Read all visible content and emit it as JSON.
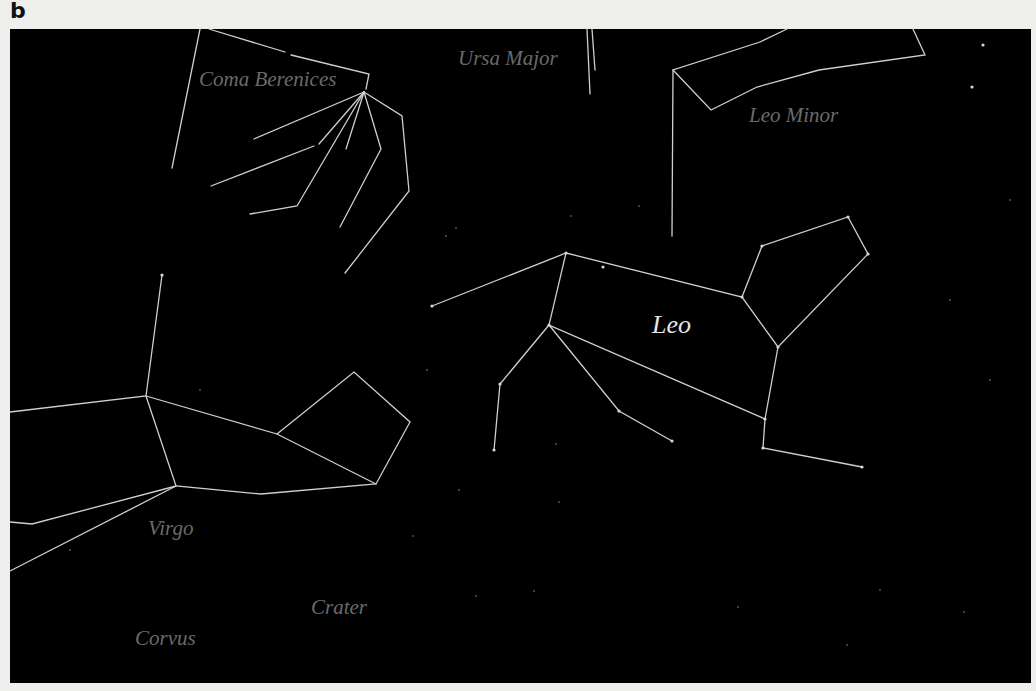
{
  "panel_label": "b",
  "sky_color": "#000000",
  "line_color": "#cfcfcf",
  "constellations": [
    {
      "id": "leo",
      "label": "Leo",
      "highlighted": true
    },
    {
      "id": "leo-minor",
      "label": "Leo Minor",
      "highlighted": false
    },
    {
      "id": "ursa-major",
      "label": "Ursa Major",
      "highlighted": false
    },
    {
      "id": "coma-berenices",
      "label": "Coma Berenices",
      "highlighted": false
    },
    {
      "id": "virgo",
      "label": "Virgo",
      "highlighted": false
    },
    {
      "id": "crater",
      "label": "Crater",
      "highlighted": false
    },
    {
      "id": "corvus",
      "label": "Corvus",
      "highlighted": false
    }
  ]
}
